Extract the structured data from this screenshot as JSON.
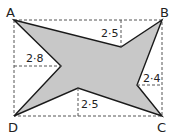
{
  "diagram": {
    "type": "geometry-figure",
    "colors": {
      "fill": "#c8c8c8",
      "outline": "#1a1a1a",
      "dashed": "#555555",
      "text": "#222222"
    },
    "vertices": {
      "A": "A",
      "B": "B",
      "C": "C",
      "D": "D"
    },
    "measurements": {
      "top": "2·5",
      "left": "2·8",
      "right": "2·4",
      "bottom": "2·5"
    }
  }
}
